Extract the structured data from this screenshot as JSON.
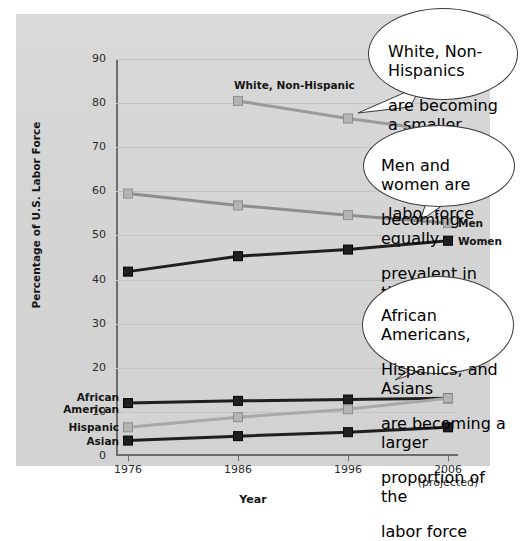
{
  "chart_data": {
    "type": "line",
    "title": "",
    "xlabel": "Year",
    "ylabel": "Percentage of U.S. Labor Force",
    "categories": [
      "1976",
      "1986",
      "1996",
      "2006"
    ],
    "x_tick_labels": [
      "1976",
      "1986",
      "1996",
      "2006"
    ],
    "x_tick_sublabels": [
      "",
      "",
      "",
      "(projected)"
    ],
    "ylim": [
      0,
      90
    ],
    "y_ticks": [
      0,
      10,
      20,
      30,
      40,
      50,
      60,
      70,
      80,
      90
    ],
    "grid": true,
    "legend_position": "inline-labels",
    "series": [
      {
        "name": "White, Non-Hispanic",
        "color": "#9a9a9a",
        "label_position": "above-first-point",
        "x": [
          "1986",
          "1996",
          "2006"
        ],
        "values": [
          80.5,
          76.5,
          73.5
        ]
      },
      {
        "name": "Men",
        "color": "#8e8e8e",
        "label_position": "right",
        "x": [
          "1976",
          "1986",
          "1996",
          "2006"
        ],
        "values": [
          59.5,
          56.8,
          54.6,
          52.8
        ]
      },
      {
        "name": "Women",
        "color": "#1f1f1f",
        "label_position": "right",
        "x": [
          "1976",
          "1986",
          "1996",
          "2006"
        ],
        "values": [
          41.8,
          45.3,
          46.8,
          48.8
        ]
      },
      {
        "name": "African American",
        "color": "#1f1f1f",
        "label_position": "left",
        "x": [
          "1976",
          "1986",
          "1996",
          "2006"
        ],
        "values": [
          12.0,
          12.5,
          12.8,
          13.1
        ]
      },
      {
        "name": "Hispanic",
        "color": "#a8a8a8",
        "label_position": "left",
        "x": [
          "1976",
          "1986",
          "1996",
          "2006"
        ],
        "values": [
          6.5,
          8.8,
          10.6,
          13.1
        ]
      },
      {
        "name": "Asian",
        "color": "#1f1f1f",
        "label_position": "left",
        "x": [
          "1976",
          "1986",
          "1996",
          "2006"
        ],
        "values": [
          3.5,
          4.5,
          5.4,
          6.5
        ]
      }
    ],
    "annotations": [
      {
        "id": "callout-white",
        "text": "White, Non-Hispanics are becoming a smaller proportion of the labor force",
        "lines": [
          "White, Non-Hispanics",
          "are becoming a smaller",
          "proportion of the",
          "labor force"
        ],
        "points_to": "White, Non-Hispanic 2006"
      },
      {
        "id": "callout-gender",
        "text": "Men and women are becoming equally prevalent in the labor force",
        "lines": [
          "Men and women are",
          "becoming equally",
          "prevalent in the",
          "labor force"
        ],
        "points_to": "Men / Women 2006"
      },
      {
        "id": "callout-minority",
        "text": "African Americans, Hispanics, and Asians are becoming a larger proportion of the labor force",
        "lines": [
          "African Americans,",
          "Hispanics, and Asians",
          "are becoming a larger",
          "proportion of the",
          "labor force"
        ],
        "points_to": "African American / Hispanic 2006"
      }
    ]
  },
  "colors": {
    "panel_background": "#d6d6d6",
    "page_background": "#ffffff",
    "axis": "#6d6d6d",
    "gridline": "#c3c3c3",
    "dark_series": "#1f1f1f",
    "light_series": "#9a9a9a",
    "callout_border": "#3a3a3a",
    "callout_fill": "#ffffff"
  }
}
